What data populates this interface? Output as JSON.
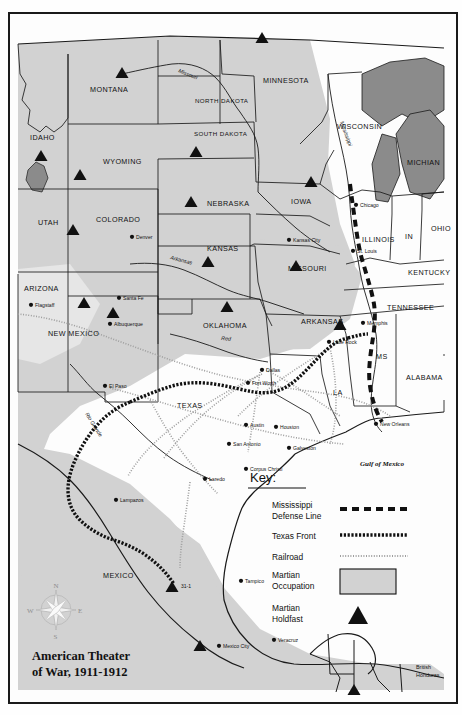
{
  "map": {
    "title_line1": "American Theater",
    "title_line2": "of War, 1911-1912",
    "sea_labels": [
      {
        "name": "gulf-of-mexico",
        "text": "Gulf of Mexico",
        "x": 372,
        "y": 452
      }
    ],
    "compass": {
      "n": "N",
      "e": "E",
      "s": "S",
      "w": "W"
    },
    "states": [
      {
        "name": "montana",
        "text": "MONTANA",
        "x": 80,
        "y": 78,
        "size": "md"
      },
      {
        "name": "idaho",
        "text": "IDAHO",
        "x": 20,
        "y": 126,
        "size": "md"
      },
      {
        "name": "wyoming",
        "text": "WYOMING",
        "x": 93,
        "y": 150,
        "size": "md"
      },
      {
        "name": "utah",
        "text": "UTAH",
        "x": 28,
        "y": 211,
        "size": "md"
      },
      {
        "name": "colorado",
        "text": "COLORADO",
        "x": 86,
        "y": 208,
        "size": "md"
      },
      {
        "name": "north-dakota",
        "text": "NORTH DAKOTA",
        "x": 185,
        "y": 89,
        "size": "md"
      },
      {
        "name": "south-dakota",
        "text": "SOUTH DAKOTA",
        "x": 184,
        "y": 122,
        "size": "md"
      },
      {
        "name": "nebraska",
        "text": "NEBRASKA",
        "x": 197,
        "y": 192,
        "size": "md"
      },
      {
        "name": "kansas",
        "text": "KANSAS",
        "x": 197,
        "y": 237,
        "size": "md"
      },
      {
        "name": "minnesota",
        "text": "MINNESOTA",
        "x": 253,
        "y": 69,
        "size": "md"
      },
      {
        "name": "iowa",
        "text": "IOWA",
        "x": 281,
        "y": 190,
        "size": "md"
      },
      {
        "name": "wisconsin",
        "text": "WISCONSIN",
        "x": 327,
        "y": 115,
        "size": "md"
      },
      {
        "name": "michigan",
        "text": "MICHIAN",
        "x": 397,
        "y": 151,
        "size": "md"
      },
      {
        "name": "illinois",
        "text": "ILLINOIS",
        "x": 352,
        "y": 228,
        "size": "md"
      },
      {
        "name": "indiana",
        "text": "IN",
        "x": 395,
        "y": 225,
        "size": "md"
      },
      {
        "name": "ohio",
        "text": "OHIO",
        "x": 421,
        "y": 217,
        "size": "md"
      },
      {
        "name": "missouri",
        "text": "MISSOURI",
        "x": 278,
        "y": 257,
        "size": "md"
      },
      {
        "name": "kentucky",
        "text": "KENTUCKY",
        "x": 398,
        "y": 261,
        "size": "md"
      },
      {
        "name": "arizona",
        "text": "ARIZONA",
        "x": 14,
        "y": 277,
        "size": "md"
      },
      {
        "name": "new-mexico",
        "text": "NEW MEXICO",
        "x": 38,
        "y": 322,
        "size": "md"
      },
      {
        "name": "oklahoma",
        "text": "OKLAHOMA",
        "x": 193,
        "y": 314,
        "size": "md"
      },
      {
        "name": "arkansas",
        "text": "ARKANSAS",
        "x": 291,
        "y": 310,
        "size": "md"
      },
      {
        "name": "tennessee",
        "text": "TENNESSEE",
        "x": 377,
        "y": 296,
        "size": "md"
      },
      {
        "name": "mississippi-state",
        "text": "MS",
        "x": 366,
        "y": 345,
        "size": "md"
      },
      {
        "name": "alabama",
        "text": "ALABAMA",
        "x": 396,
        "y": 366,
        "size": "md"
      },
      {
        "name": "louisiana",
        "text": "LA",
        "x": 323,
        "y": 381,
        "size": "md"
      },
      {
        "name": "texas",
        "text": "TEXAS",
        "x": 167,
        "y": 394,
        "size": "md"
      },
      {
        "name": "mexico",
        "text": "MEXICO",
        "x": 93,
        "y": 564,
        "size": "md"
      }
    ],
    "cities": [
      {
        "name": "denver",
        "text": "Denver",
        "x": 126,
        "y": 225,
        "dot": true
      },
      {
        "name": "flagstaff",
        "text": "Flagstaff",
        "x": 25,
        "y": 293,
        "dot": true
      },
      {
        "name": "santa-fe",
        "text": "Santa Fe",
        "x": 113,
        "y": 286,
        "dot": true
      },
      {
        "name": "albuquerque",
        "text": "Albuquerque",
        "x": 104,
        "y": 312,
        "dot": true
      },
      {
        "name": "el-paso",
        "text": "El Paso",
        "x": 99,
        "y": 374,
        "dot": true
      },
      {
        "name": "kansas-city",
        "text": "Kansas City",
        "x": 283,
        "y": 228,
        "dot": true
      },
      {
        "name": "st-louis",
        "text": "St. Louis",
        "x": 347,
        "y": 239,
        "dot": true
      },
      {
        "name": "chicago",
        "text": "Chicago",
        "x": 350,
        "y": 193,
        "dot": true
      },
      {
        "name": "memphis",
        "text": "Memphis",
        "x": 357,
        "y": 311,
        "dot": true
      },
      {
        "name": "little-rock",
        "text": "Little Rock",
        "x": 323,
        "y": 330,
        "dot": true
      },
      {
        "name": "dallas",
        "text": "Dallas",
        "x": 256,
        "y": 358,
        "dot": true
      },
      {
        "name": "fort-worth",
        "text": "Fort Worth",
        "x": 242,
        "y": 371,
        "dot": true
      },
      {
        "name": "new-orleans",
        "text": "New Orleans",
        "x": 370,
        "y": 412,
        "dot": true
      },
      {
        "name": "austin",
        "text": "Austin",
        "x": 240,
        "y": 413,
        "dot": true
      },
      {
        "name": "houston",
        "text": "Houston",
        "x": 270,
        "y": 415,
        "dot": true
      },
      {
        "name": "galveston",
        "text": "Galveston",
        "x": 283,
        "y": 436,
        "dot": true
      },
      {
        "name": "san-antonio",
        "text": "San Antonio",
        "x": 223,
        "y": 432,
        "dot": true
      },
      {
        "name": "corpus-christi",
        "text": "Corpus Christi",
        "x": 240,
        "y": 457,
        "dot": true
      },
      {
        "name": "laredo",
        "text": "Laredo",
        "x": 199,
        "y": 467,
        "dot": true
      },
      {
        "name": "lampazos",
        "text": "Lampazos",
        "x": 110,
        "y": 488,
        "dot": true
      },
      {
        "name": "tampico",
        "text": "Tampico",
        "x": 235,
        "y": 569,
        "dot": true
      },
      {
        "name": "mexico-city",
        "text": "Mexico City",
        "x": 213,
        "y": 634,
        "dot": true
      },
      {
        "name": "veracruz",
        "text": "Veracruz",
        "x": 268,
        "y": 628,
        "dot": true
      }
    ],
    "rivers": [
      {
        "name": "missouri-river",
        "text": "Missouri",
        "x": 168,
        "y": 58,
        "rot": 22
      },
      {
        "name": "mississippi-river",
        "text": "Mississippi",
        "x": 330,
        "y": 108,
        "rot": 70
      },
      {
        "name": "arkansas-river",
        "text": "Arkansas",
        "x": 160,
        "y": 245,
        "rot": 15
      },
      {
        "name": "red-river",
        "text": "Red",
        "x": 211,
        "y": 326,
        "rot": 5
      },
      {
        "name": "rio-grande-river",
        "text": "Rio Grande",
        "x": 75,
        "y": 400,
        "rot": 58
      }
    ],
    "countries": [
      {
        "name": "british-honduras",
        "text": "British\nHonduras",
        "x": 406,
        "y": 655
      },
      {
        "name": "guatemala",
        "text": "Guatemala",
        "x": 355,
        "y": 692
      },
      {
        "name": "honduras",
        "text": "Honduras",
        "x": 416,
        "y": 692
      }
    ],
    "holdfast_markers": [
      {
        "name": "holdfast-montana",
        "x": 112,
        "y": 59
      },
      {
        "name": "holdfast-wyoming",
        "x": 70,
        "y": 161
      },
      {
        "name": "holdfast-idaho",
        "x": 31,
        "y": 142
      },
      {
        "name": "holdfast-utah",
        "x": 63,
        "y": 216
      },
      {
        "name": "holdfast-south-dakota",
        "x": 186,
        "y": 138
      },
      {
        "name": "holdfast-minnesota",
        "x": 252,
        "y": 24
      },
      {
        "name": "holdfast-nebraska",
        "x": 181,
        "y": 188
      },
      {
        "name": "holdfast-kansas",
        "x": 198,
        "y": 248
      },
      {
        "name": "holdfast-iowa",
        "x": 301,
        "y": 168
      },
      {
        "name": "holdfast-missouri",
        "x": 286,
        "y": 252
      },
      {
        "name": "holdfast-arkansas",
        "x": 330,
        "y": 311
      },
      {
        "name": "holdfast-arizona",
        "x": 74,
        "y": 289
      },
      {
        "name": "holdfast-new-mexico",
        "x": 103,
        "y": 299
      },
      {
        "name": "holdfast-oklahoma",
        "x": 217,
        "y": 293
      },
      {
        "name": "holdfast-mexico-31-1",
        "x": 162,
        "y": 573,
        "label": "31-1"
      },
      {
        "name": "holdfast-mexico-city",
        "x": 190,
        "y": 632
      },
      {
        "name": "holdfast-guatemala",
        "x": 344,
        "y": 676
      }
    ],
    "key": {
      "heading": "Key:",
      "items": [
        {
          "name": "key-mississippi-defense-line",
          "label": "Mississippi\nDefense Line",
          "symbol": "dashed-thick-line"
        },
        {
          "name": "key-texas-front",
          "label": "Texas Front",
          "symbol": "dotted-thick-line"
        },
        {
          "name": "key-railroad",
          "label": "Railroad",
          "symbol": "hatched-thin-line"
        },
        {
          "name": "key-martian-occupation",
          "label": "Martian\nOccupation",
          "symbol": "gray-filled-rect"
        },
        {
          "name": "key-martian-holdfast",
          "label": "Martian\nHoldfast",
          "symbol": "black-triangle"
        }
      ]
    },
    "colors": {
      "occupation_fill": "#d2d2d2",
      "unoccupied_fill": "#fbfbfb",
      "water_fill": "#8b8b8b",
      "border_stroke": "#1a1a1a",
      "paper": "#fdfdfd"
    }
  }
}
